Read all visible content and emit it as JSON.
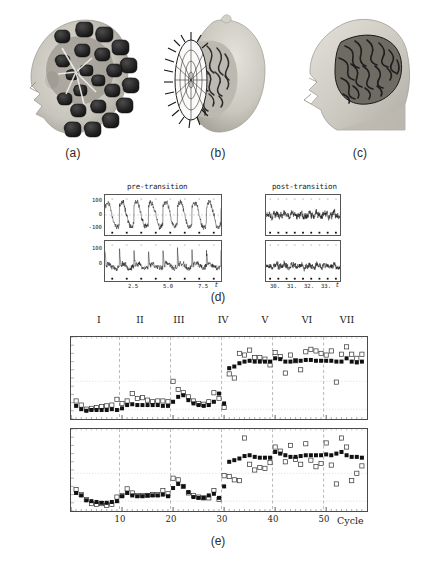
{
  "figure": {
    "panels": [
      {
        "id": "a",
        "caption": "(a)",
        "description": "head-with-meg-sensor-array"
      },
      {
        "id": "b",
        "caption": "(b)",
        "description": "sensor-helmet-and-brain-surface"
      },
      {
        "id": "c",
        "caption": "(c)",
        "description": "head-with-brain-cutaway"
      },
      {
        "id": "d",
        "caption": "(d)",
        "description": "meg-time-series-pre-and-post-transition"
      },
      {
        "id": "e",
        "caption": "(e)",
        "description": "cycle-by-cycle-phase-measures"
      }
    ]
  },
  "panel_d": {
    "left_title": "pre-transition",
    "right_title": "post-transition",
    "xvar": "t",
    "left": {
      "yticks": [
        "100",
        "0",
        "-100"
      ],
      "xticks": [
        "2.5",
        "5.0",
        "7.5"
      ]
    },
    "right": {
      "yticks": [
        "100",
        "0"
      ],
      "xticks": [
        "30.",
        "31.",
        "32.",
        "33."
      ]
    }
  },
  "panel_e": {
    "regions": [
      "I",
      "II",
      "III",
      "IV",
      "V",
      "VI",
      "VII"
    ],
    "xticks": [
      "10",
      "20",
      "30",
      "40",
      "50"
    ],
    "xlabel": "Cycle"
  },
  "colors": {
    "ink": "#1a1a1a",
    "frame": "#4a4a4a",
    "trace": "#111111",
    "filled_marker": "#111111",
    "open_marker": "#333333",
    "grid": "#cfcfcf",
    "dashed_divider": "#8a8a8a",
    "skin": "#c9c6bf",
    "sensor": "#232323",
    "brain": "#4a4a4a"
  },
  "chart_data": [
    {
      "type": "line",
      "name": "panel-d-pre-transition-top",
      "title": "pre-transition",
      "xlabel": "t",
      "ylabel": "",
      "xlim": [
        0.6,
        8.9
      ],
      "ylim": [
        -190,
        190
      ],
      "yticks": [
        100,
        0,
        -100
      ],
      "xticks": [
        2.5,
        5.0,
        7.5
      ],
      "description": "large amplitude ~1.25 Hz oscillatory MEG trace, 8 full cycles",
      "n_cycles": 8,
      "period": 1.0,
      "amplitude": 130,
      "noise": 32,
      "seed": 11,
      "stimulus_marks_y": -168,
      "n_marks": 8
    },
    {
      "type": "line",
      "name": "panel-d-pre-transition-bottom",
      "title": "",
      "xlabel": "t",
      "ylabel": "",
      "xlim": [
        0.6,
        8.9
      ],
      "ylim": [
        -120,
        200
      ],
      "yticks": [
        100,
        0
      ],
      "xticks": [
        2.5,
        5.0,
        7.5
      ],
      "description": "lower amplitude trace with periodic upward spikes aligned to stimulus",
      "n_cycles": 8,
      "period": 1.0,
      "amplitude": 55,
      "noise": 26,
      "seed": 23,
      "stimulus_marks_y": -100,
      "n_marks": 8
    },
    {
      "type": "line",
      "name": "panel-d-post-transition-top",
      "title": "post-transition",
      "xlabel": "t",
      "ylabel": "",
      "xlim": [
        29.4,
        33.9
      ],
      "ylim": [
        -190,
        190
      ],
      "yticks": [
        100,
        0
      ],
      "xticks": [
        30,
        31,
        32,
        33
      ],
      "description": "reduced amplitude irregular trace after transition",
      "n_cycles": 9,
      "period": 0.5,
      "amplitude": 30,
      "noise": 34,
      "seed": 37,
      "stimulus_marks_y": -150,
      "n_marks": 9
    },
    {
      "type": "line",
      "name": "panel-d-post-transition-bottom",
      "title": "",
      "xlabel": "t",
      "ylabel": "",
      "xlim": [
        29.4,
        33.9
      ],
      "ylim": [
        -120,
        200
      ],
      "yticks": [
        100,
        0
      ],
      "xticks": [
        30,
        31,
        32,
        33
      ],
      "description": "low amplitude noisy trace after transition",
      "n_cycles": 9,
      "period": 0.5,
      "amplitude": 22,
      "noise": 26,
      "seed": 53,
      "stimulus_marks_y": -95,
      "n_marks": 9
    },
    {
      "type": "scatter",
      "name": "panel-e-top",
      "title": "",
      "xlabel": "",
      "ylabel": "",
      "xlim": [
        0,
        58
      ],
      "ylim": [
        0,
        1
      ],
      "grid": true,
      "legend": [
        "filled-square",
        "open-square"
      ],
      "region_boundaries": [
        9,
        19,
        29,
        39,
        49
      ],
      "x": [
        1,
        2,
        3,
        4,
        5,
        6,
        7,
        8,
        9,
        10,
        11,
        12,
        13,
        14,
        15,
        16,
        17,
        18,
        19,
        20,
        21,
        22,
        23,
        24,
        25,
        26,
        27,
        28,
        29,
        30,
        31,
        32,
        33,
        34,
        35,
        36,
        37,
        38,
        39,
        40,
        41,
        42,
        43,
        44,
        45,
        46,
        47,
        48,
        49,
        50,
        51,
        52,
        53,
        54,
        55,
        56,
        57
      ],
      "series": [
        {
          "name": "filled-square",
          "values": [
            0.16,
            0.12,
            0.1,
            0.11,
            0.11,
            0.11,
            0.11,
            0.12,
            0.11,
            0.13,
            0.17,
            0.18,
            0.17,
            0.17,
            0.17,
            0.17,
            0.17,
            0.16,
            0.16,
            0.21,
            0.27,
            0.29,
            0.23,
            0.19,
            0.17,
            0.16,
            0.17,
            0.21,
            0.31,
            0.19,
            0.62,
            0.64,
            0.68,
            0.7,
            0.71,
            0.7,
            0.7,
            0.7,
            0.7,
            0.74,
            0.73,
            0.7,
            0.7,
            0.71,
            0.71,
            0.72,
            0.72,
            0.71,
            0.71,
            0.71,
            0.71,
            0.7,
            0.7,
            0.74,
            0.7,
            0.69,
            0.7
          ]
        },
        {
          "name": "open-square",
          "values": [
            0.22,
            0.17,
            0.12,
            0.13,
            0.14,
            0.15,
            0.16,
            0.17,
            0.24,
            0.19,
            0.22,
            0.31,
            0.25,
            0.26,
            0.23,
            0.21,
            0.22,
            0.22,
            0.21,
            0.46,
            0.36,
            0.32,
            0.27,
            0.22,
            0.19,
            0.18,
            0.21,
            0.32,
            0.25,
            0.14,
            0.55,
            0.5,
            0.8,
            0.78,
            0.84,
            0.75,
            0.75,
            0.73,
            0.66,
            0.81,
            0.76,
            0.56,
            0.78,
            0.71,
            0.6,
            0.82,
            0.85,
            0.83,
            0.8,
            0.78,
            0.83,
            0.45,
            0.79,
            0.88,
            0.79,
            0.74,
            0.79
          ]
        }
      ]
    },
    {
      "type": "scatter",
      "name": "panel-e-bottom",
      "title": "",
      "xlabel": "Cycle",
      "ylabel": "",
      "xlim": [
        0,
        58
      ],
      "ylim": [
        0,
        1
      ],
      "grid": true,
      "legend": [
        "filled-square",
        "open-square"
      ],
      "region_boundaries": [
        9,
        19,
        29,
        39,
        49
      ],
      "x": [
        1,
        2,
        3,
        4,
        5,
        6,
        7,
        8,
        9,
        10,
        11,
        12,
        13,
        14,
        15,
        16,
        17,
        18,
        19,
        20,
        21,
        22,
        23,
        24,
        25,
        26,
        27,
        28,
        29,
        30,
        31,
        32,
        33,
        34,
        35,
        36,
        37,
        38,
        39,
        40,
        41,
        42,
        43,
        44,
        45,
        46,
        47,
        48,
        49,
        50,
        51,
        52,
        53,
        54,
        55,
        56,
        57
      ],
      "series": [
        {
          "name": "filled-square",
          "values": [
            0.22,
            0.19,
            0.13,
            0.12,
            0.11,
            0.1,
            0.1,
            0.11,
            0.12,
            0.18,
            0.22,
            0.19,
            0.18,
            0.18,
            0.19,
            0.19,
            0.19,
            0.2,
            0.18,
            0.28,
            0.33,
            0.3,
            0.23,
            0.17,
            0.16,
            0.16,
            0.19,
            0.21,
            0.16,
            0.3,
            0.6,
            0.62,
            0.64,
            0.67,
            0.68,
            0.66,
            0.65,
            0.65,
            0.65,
            0.72,
            0.7,
            0.68,
            0.66,
            0.66,
            0.67,
            0.68,
            0.68,
            0.68,
            0.68,
            0.69,
            0.68,
            0.7,
            0.72,
            0.68,
            0.66,
            0.66,
            0.65
          ]
        },
        {
          "name": "open-square",
          "values": [
            0.26,
            0.2,
            0.14,
            0.09,
            0.08,
            0.09,
            0.07,
            0.08,
            0.17,
            0.19,
            0.27,
            0.22,
            0.19,
            0.19,
            0.19,
            0.2,
            0.2,
            0.25,
            0.21,
            0.4,
            0.38,
            0.3,
            0.22,
            0.19,
            0.17,
            0.16,
            0.16,
            0.25,
            0.14,
            0.43,
            0.42,
            0.38,
            0.37,
            0.89,
            0.57,
            0.5,
            0.53,
            0.52,
            0.59,
            0.78,
            0.73,
            0.6,
            0.8,
            0.63,
            0.57,
            0.82,
            0.62,
            0.54,
            0.58,
            0.83,
            0.56,
            0.33,
            0.89,
            0.78,
            0.37,
            0.46,
            0.55
          ]
        }
      ]
    }
  ]
}
